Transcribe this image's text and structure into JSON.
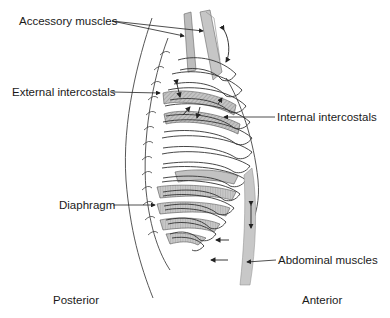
{
  "labels": {
    "accessory": "Accessory muscles",
    "external": "External intercostals",
    "internal": "Internal intercostals",
    "diaphragm": "Diaphragm",
    "abdominal": "Abdominal muscles",
    "posterior": "Posterior",
    "anterior": "Anterior"
  },
  "colors": {
    "line": "#333333",
    "muscle": "#b8b8b8",
    "muscle_light": "#cfcfcf",
    "hatch": "#9a9a9a",
    "background": "#ffffff"
  }
}
